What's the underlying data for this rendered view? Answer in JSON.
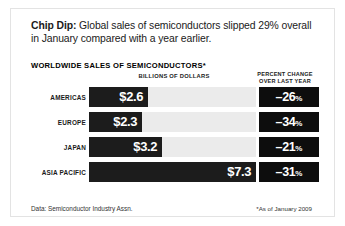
{
  "headline": {
    "lead": "Chip Dip:",
    "text": " Global sales of semiconductors slipped 29% overall in January compared with a year earlier."
  },
  "chart_data": {
    "type": "bar",
    "orientation": "horizontal",
    "title": "WORLDWIDE SALES OF SEMICONDUCTORS*",
    "xlabel": "BILLIONS OF DOLLARS",
    "ylabel": "",
    "secondary_column_header": "PERCENT CHANGE OVER LAST YEAR",
    "categories": [
      "AMERICAS",
      "EUROPE",
      "JAPAN",
      "ASIA PACIFIC"
    ],
    "values": [
      2.6,
      2.3,
      3.2,
      7.3
    ],
    "value_labels": [
      "$2.6",
      "$2.3",
      "$3.2",
      "$7.3"
    ],
    "series": [
      {
        "name": "Sales (billions of dollars)",
        "values": [
          2.6,
          2.3,
          3.2,
          7.3
        ]
      },
      {
        "name": "Percent change over last year",
        "values": [
          -26,
          -34,
          -21,
          -31
        ]
      }
    ],
    "percent_change": [
      -26,
      -34,
      -21,
      -31
    ],
    "percent_labels": [
      "–26",
      "–34",
      "–21",
      "–31"
    ],
    "percent_suffix": "%",
    "xlim": [
      0,
      7.3
    ],
    "grid": false,
    "legend": "none",
    "bar_color": "#1c1c1c",
    "track_color": "#ebebeb",
    "percent_box_color": "#0d0d0d"
  },
  "footer": {
    "source": "Data: Semiconductor Industry Assn.",
    "note": "*As of January 2009"
  }
}
